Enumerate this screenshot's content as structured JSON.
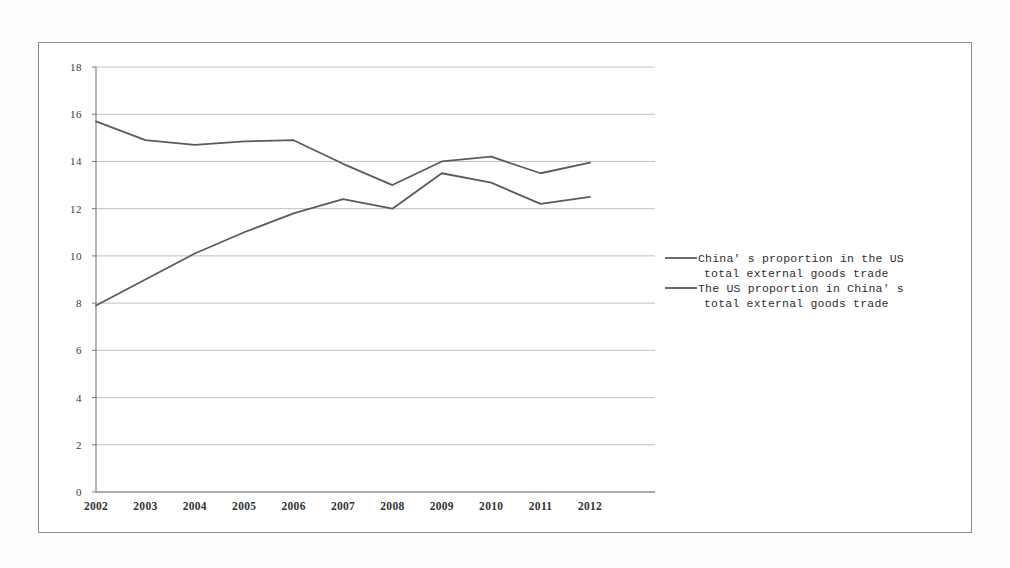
{
  "chart_data": {
    "type": "line",
    "title": "",
    "subtitle": "",
    "xlabel": "",
    "ylabel": "",
    "categories": [
      "2002",
      "2003",
      "2004",
      "2005",
      "2006",
      "2007",
      "2008",
      "2009",
      "2010",
      "2011",
      "2012"
    ],
    "x": [
      2002,
      2003,
      2004,
      2005,
      2006,
      2007,
      2008,
      2009,
      2010,
      2011,
      2012
    ],
    "ylim": [
      0,
      18
    ],
    "ytick_labels": [
      "0",
      "2",
      "4",
      "6",
      "8",
      "10",
      "12",
      "14",
      "16",
      "18"
    ],
    "yticks": [
      0,
      2,
      4,
      6,
      8,
      10,
      12,
      14,
      16,
      18
    ],
    "grid": true,
    "legend_position": "right",
    "series": [
      {
        "name": "China's proportion in the US total external goods trade",
        "color": "#5b5b5b",
        "values": [
          7.9,
          9.0,
          10.1,
          11.0,
          11.8,
          12.4,
          12.0,
          13.5,
          13.1,
          12.2,
          12.5
        ]
      },
      {
        "name": "The US proportion in China's total external goods trade",
        "color": "#5b5b5b",
        "values": [
          15.7,
          14.9,
          14.7,
          14.85,
          14.9,
          13.9,
          13.0,
          14.0,
          14.2,
          13.5,
          13.95
        ]
      }
    ],
    "legend": [
      {
        "line1": "China' s proportion in the US",
        "line2": "total external goods trade"
      },
      {
        "line1": "The US proportion in China' s",
        "line2": "total external goods trade"
      }
    ]
  }
}
